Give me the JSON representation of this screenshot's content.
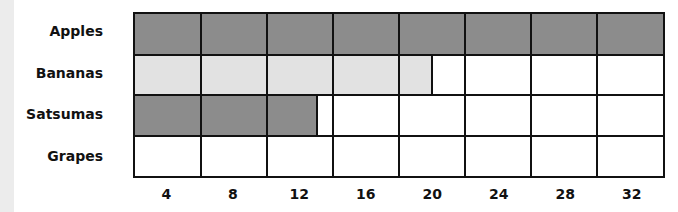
{
  "chart_data": {
    "type": "bar",
    "orientation": "horizontal",
    "title": "",
    "xlabel": "",
    "ylabel": "",
    "categories": [
      "Apples",
      "Bananas",
      "Satsumas",
      "Grapes"
    ],
    "values": [
      32,
      18,
      11,
      0
    ],
    "xlim": [
      0,
      32
    ],
    "x_ticks": [
      4,
      8,
      12,
      16,
      20,
      24,
      28,
      32
    ],
    "grid": true,
    "legend": null,
    "bar_colors": [
      "#8c8c8c",
      "#e2e2e2",
      "#8c8c8c",
      "#ffffff"
    ]
  },
  "labels": {
    "apples": "Apples",
    "bananas": "Bananas",
    "satsumas": "Satsumas",
    "grapes": "Grapes"
  },
  "ticks": [
    "4",
    "8",
    "12",
    "16",
    "20",
    "24",
    "28",
    "32"
  ]
}
